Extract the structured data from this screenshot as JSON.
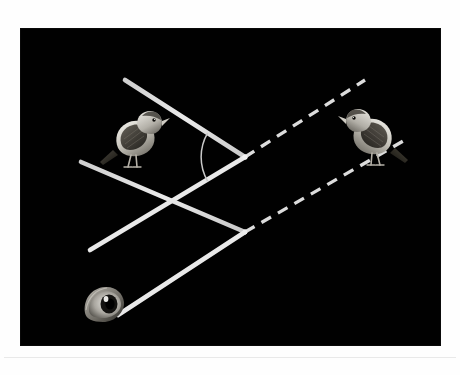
{
  "figure": {
    "type": "optics-reflection-diagram",
    "background_color": "#010101",
    "stroke_color": "#d8d8d8",
    "panel": {
      "x": 21,
      "y": 29,
      "width": 419,
      "height": 316
    },
    "icons": {
      "real_bird": "bird-icon",
      "virtual_bird": "bird-icon",
      "observer": "eye-icon"
    },
    "elements": {
      "mirror_axis": {
        "name": "vertical-mirror-axis",
        "style": "solid",
        "x1": 224,
        "y1": 16,
        "x2": 224,
        "y2": 296
      },
      "normal_axis": {
        "name": "horizontal-normal-axis",
        "style": "dotted",
        "x1": 55,
        "y1": 128,
        "x2": 290,
        "y2": 128
      },
      "incident_ray_upper": {
        "name": "incident-ray-upper",
        "style": "solid",
        "x1": 104,
        "y1": 51,
        "x2": 224,
        "y2": 128
      },
      "incident_ray_lower": {
        "name": "incident-ray-lower",
        "style": "solid",
        "x1": 69,
        "y1": 221,
        "x2": 224,
        "y2": 128
      },
      "reflected_ray_upper": {
        "name": "reflected-ray-upper",
        "style": "solid",
        "x1": 60,
        "y1": 133,
        "x2": 224,
        "y2": 203
      },
      "reflected_ray_lower": {
        "name": "reflected-ray-lower",
        "style": "solid",
        "x1": 97,
        "y1": 286,
        "x2": 224,
        "y2": 203
      },
      "virtual_ray_upper": {
        "name": "virtual-ray-upper",
        "style": "dashed",
        "x1": 224,
        "y1": 128,
        "x2": 344,
        "y2": 51
      },
      "virtual_ray_lower": {
        "name": "virtual-ray-lower",
        "style": "dashed",
        "x1": 224,
        "y1": 203,
        "x2": 384,
        "y2": 111
      },
      "angle_arc": {
        "name": "angle-of-incidence-arc",
        "style": "solid-arc",
        "vertex_x": 224,
        "vertex_y": 128,
        "radius": 48
      },
      "vertex_upper": {
        "name": "upper-vertex-point",
        "x": 224,
        "y": 128
      },
      "vertex_lower": {
        "name": "lower-vertex-point",
        "x": 224,
        "y": 203
      }
    }
  }
}
